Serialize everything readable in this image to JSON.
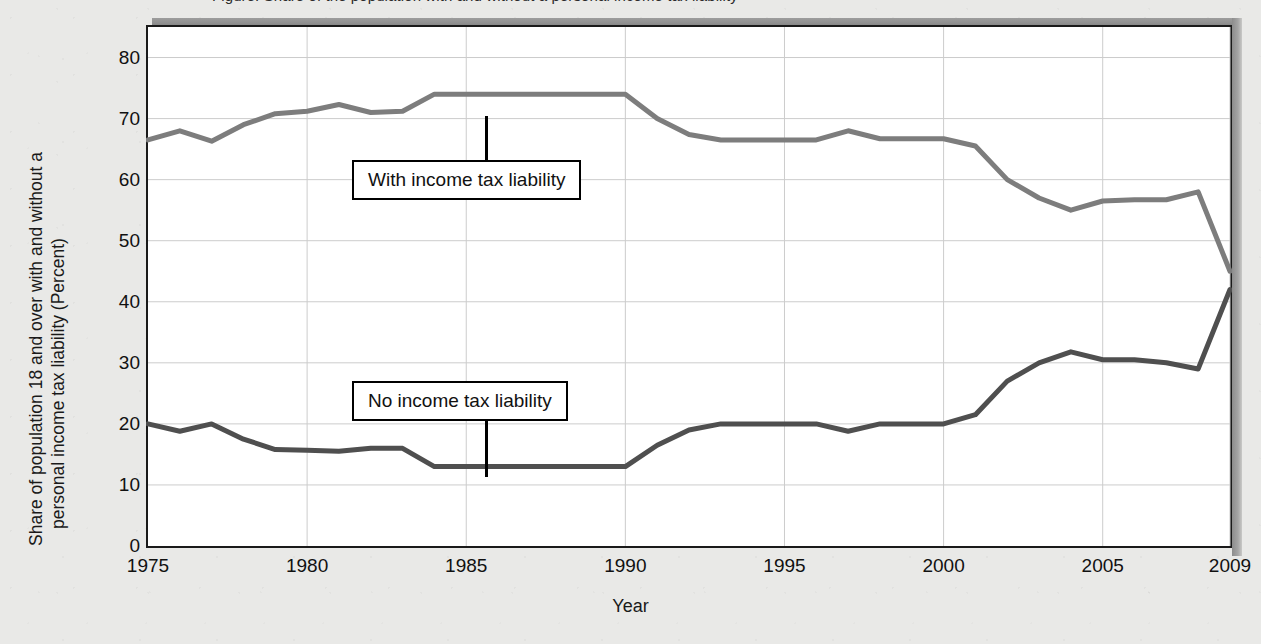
{
  "figure": {
    "title_clipped": "Figure: Share of the population with and without a personal income tax liability",
    "background_color": "#e9e9e7",
    "plot_background": "#ffffff"
  },
  "axes": {
    "y_title_line1": "Share of population 18 and over with and without a",
    "y_title_line2": "personal income tax liability (Percent)",
    "x_title": "Year",
    "y_ticks": [
      "0",
      "10",
      "20",
      "30",
      "40",
      "50",
      "60",
      "70",
      "80"
    ],
    "x_ticks": [
      "1975",
      "1980",
      "1985",
      "1990",
      "1995",
      "2000",
      "2005",
      "2009"
    ]
  },
  "annotations": {
    "with_label": "With income tax liability",
    "no_label": "No income tax liability"
  },
  "chart_data": {
    "type": "line",
    "xlabel": "Year",
    "ylabel": "Share of population 18 and over with and without a personal income tax liability (Percent)",
    "xlim": [
      1975,
      2009
    ],
    "ylim": [
      0,
      85
    ],
    "ytick_values": [
      0,
      10,
      20,
      30,
      40,
      50,
      60,
      70,
      80
    ],
    "xtick_values": [
      1975,
      1980,
      1985,
      1990,
      1995,
      2000,
      2005,
      2009
    ],
    "grid": true,
    "legend": "inline-callout-labels",
    "x": [
      1975,
      1976,
      1977,
      1978,
      1979,
      1980,
      1981,
      1982,
      1983,
      1984,
      1985,
      1986,
      1987,
      1988,
      1989,
      1990,
      1991,
      1992,
      1993,
      1994,
      1995,
      1996,
      1997,
      1998,
      1999,
      2000,
      2001,
      2002,
      2003,
      2004,
      2005,
      2006,
      2007,
      2008,
      2009
    ],
    "series": [
      {
        "name": "With income tax liability",
        "color": "#7d7d7d",
        "values": [
          66.5,
          68.0,
          66.3,
          69.0,
          70.8,
          71.2,
          72.3,
          71.0,
          71.2,
          74.0,
          74.0,
          74.0,
          74.0,
          74.0,
          74.0,
          74.0,
          70.0,
          67.4,
          66.5,
          66.5,
          66.5,
          66.5,
          68.0,
          66.7,
          66.7,
          66.7,
          65.5,
          60.0,
          57.0,
          55.0,
          56.5,
          56.7,
          56.7,
          58.0,
          45.0
        ]
      },
      {
        "name": "No income tax liability",
        "color": "#4f4f4f",
        "values": [
          20.0,
          18.8,
          20.0,
          17.5,
          15.8,
          15.7,
          15.5,
          16.0,
          16.0,
          13.0,
          13.0,
          13.0,
          13.0,
          13.0,
          13.0,
          13.0,
          16.5,
          19.0,
          20.0,
          20.0,
          20.0,
          20.0,
          18.8,
          20.0,
          20.0,
          20.0,
          21.5,
          27.0,
          30.0,
          31.8,
          30.5,
          30.5,
          30.0,
          29.0,
          42.0
        ]
      }
    ]
  }
}
